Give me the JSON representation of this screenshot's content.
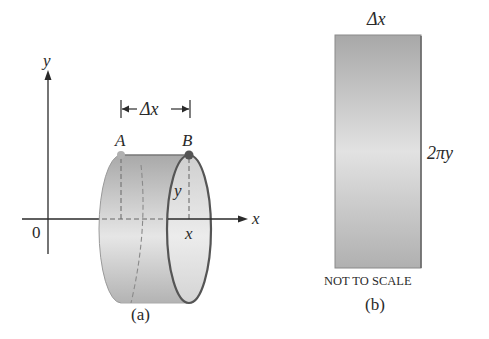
{
  "panel_a": {
    "axis_x_label": "x",
    "axis_y_label": "y",
    "origin_label": "0",
    "delta_label": "Δx",
    "point_a_label": "A",
    "point_b_label": "B",
    "radius_label": "y",
    "x_position_label": "x",
    "caption": "(a)"
  },
  "panel_b": {
    "width_label": "Δx",
    "height_label": "2πy",
    "note": "NOT TO SCALE",
    "caption": "(b)"
  },
  "colors": {
    "line": "#2a2a2a",
    "cylinder_dark": "#a8a8a8",
    "cylinder_light": "#e4e4e4",
    "rim": "#555555",
    "point_a": "#b0b0b0",
    "point_b": "#555555"
  }
}
